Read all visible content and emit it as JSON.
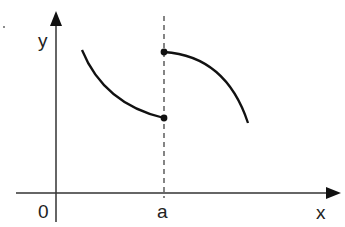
{
  "diagram": {
    "type": "piecewise-function-graph",
    "axes": {
      "x_label": "x",
      "y_label": "y",
      "origin_label": "0"
    },
    "marker": {
      "label": "a",
      "style": "dashed vertical line at x = a"
    },
    "curves": [
      {
        "name": "left-branch",
        "description": "decreasing concave-up curve ending with filled dot at x = a (lower value)"
      },
      {
        "name": "right-branch",
        "description": "decreasing concave-down curve starting with filled dot at x = a (upper value)"
      }
    ],
    "points": [
      {
        "name": "upper-endpoint",
        "filled": true
      },
      {
        "name": "lower-endpoint",
        "filled": true
      }
    ],
    "colors": {
      "ink": "#111111",
      "axis": "#333333",
      "dash": "#444444"
    }
  }
}
